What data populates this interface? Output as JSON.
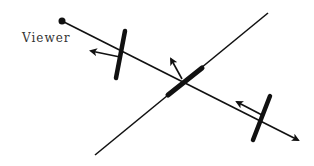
{
  "diagram": {
    "type": "reflection-geometry",
    "colors": {
      "ink": "#111111",
      "label": "#333333",
      "background": "#ffffff"
    },
    "viewer": {
      "label": "Viewer",
      "label_pos": [
        22,
        43
      ],
      "point": [
        62,
        21
      ],
      "ray_end": [
        298,
        140
      ]
    },
    "reference_line": {
      "from": [
        95,
        155
      ],
      "to": [
        268,
        13
      ]
    },
    "mirrors": [
      {
        "name": "left",
        "bar": {
          "from": [
            125,
            31
          ],
          "to": [
            116,
            78
          ]
        },
        "normal": {
          "from": [
            120,
            57
          ],
          "to": [
            91,
            51
          ]
        }
      },
      {
        "name": "center",
        "bar": {
          "from": [
            168,
            95
          ],
          "to": [
            202,
            68
          ]
        },
        "normal": {
          "from": [
            182,
            79
          ],
          "to": [
            171,
            59
          ]
        }
      },
      {
        "name": "right",
        "bar": {
          "from": [
            270,
            96
          ],
          "to": [
            253,
            140
          ]
        },
        "normal": {
          "from": [
            262,
            115
          ],
          "to": [
            237,
            102
          ]
        }
      }
    ]
  }
}
